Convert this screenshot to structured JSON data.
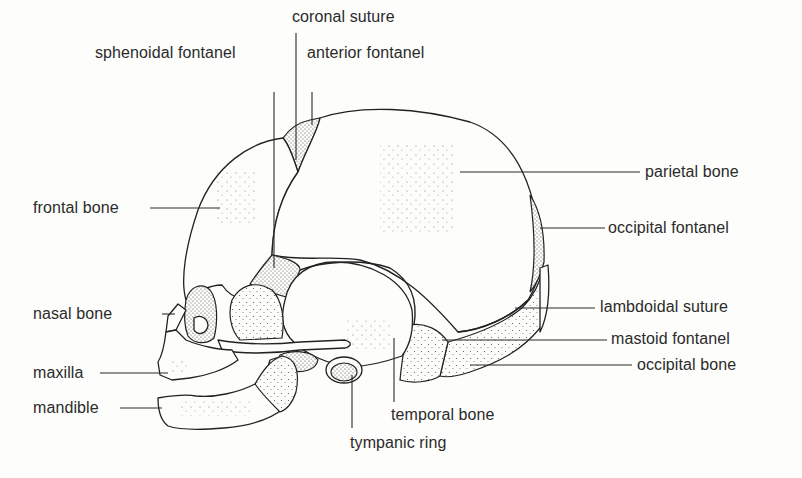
{
  "diagram": {
    "labels": {
      "coronal_suture": "coronal suture",
      "sphenoidal_fontanel": "sphenoidal fontanel",
      "anterior_fontanel": "anterior fontanel",
      "parietal_bone": "parietal bone",
      "frontal_bone": "frontal bone",
      "occipital_fontanel": "occipital fontanel",
      "nasal_bone": "nasal bone",
      "lambdoidal_suture": "lambdoidal suture",
      "mastoid_fontanel": "mastoid fontanel",
      "maxilla": "maxilla",
      "occipital_bone": "occipital bone",
      "mandible": "mandible",
      "temporal_bone": "temporal bone",
      "tympanic_ring": "tympanic ring"
    },
    "colors": {
      "background": "#fdfdfb",
      "ink": "#222222",
      "text": "#2b2b2b"
    }
  }
}
